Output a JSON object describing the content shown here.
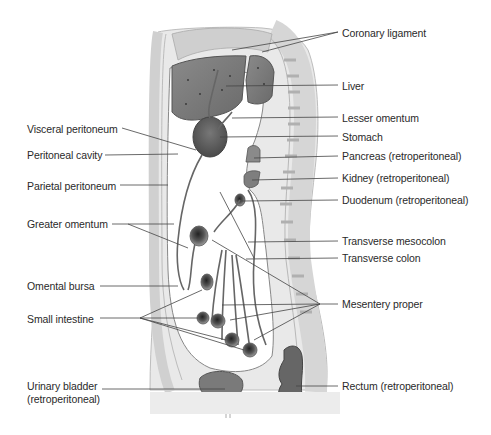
{
  "figure": {
    "labels_left": [
      {
        "id": "visceral-peritoneum",
        "text": "Visceral peritoneum",
        "x": 27,
        "y": 123
      },
      {
        "id": "peritoneal-cavity",
        "text": "Peritoneal cavity",
        "x": 27,
        "y": 149
      },
      {
        "id": "parietal-peritoneum",
        "text": "Parietal peritoneum",
        "x": 27,
        "y": 180
      },
      {
        "id": "greater-omentum",
        "text": "Greater omentum",
        "x": 27,
        "y": 218
      },
      {
        "id": "omental-bursa",
        "text": "Omental bursa",
        "x": 27,
        "y": 280
      },
      {
        "id": "small-intestine",
        "text": "Small intestine",
        "x": 27,
        "y": 313
      },
      {
        "id": "urinary-bladder",
        "text": "Urinary bladder",
        "x": 27,
        "y": 380
      },
      {
        "id": "urinary-bladder-sub",
        "text": "(retroperitoneal)",
        "x": 27,
        "y": 393
      }
    ],
    "labels_right": [
      {
        "id": "coronary-ligament",
        "text": "Coronary ligament",
        "x": 342,
        "y": 27
      },
      {
        "id": "liver",
        "text": "Liver",
        "x": 342,
        "y": 80
      },
      {
        "id": "lesser-omentum",
        "text": "Lesser omentum",
        "x": 342,
        "y": 112
      },
      {
        "id": "stomach",
        "text": "Stomach",
        "x": 342,
        "y": 131
      },
      {
        "id": "pancreas",
        "text": "Pancreas (retroperitoneal)",
        "x": 342,
        "y": 150
      },
      {
        "id": "kidney",
        "text": "Kidney (retroperitoneal)",
        "x": 342,
        "y": 172
      },
      {
        "id": "duodenum",
        "text": "Duodenum (retroperitoneal)",
        "x": 342,
        "y": 194
      },
      {
        "id": "transverse-mesocolon",
        "text": "Transverse mesocolon",
        "x": 342,
        "y": 235
      },
      {
        "id": "transverse-colon",
        "text": "Transverse colon",
        "x": 342,
        "y": 252
      },
      {
        "id": "mesentery-proper",
        "text": "Mesentery proper",
        "x": 342,
        "y": 298
      },
      {
        "id": "rectum",
        "text": "Rectum (retroperitoneal)",
        "x": 342,
        "y": 380
      }
    ]
  }
}
